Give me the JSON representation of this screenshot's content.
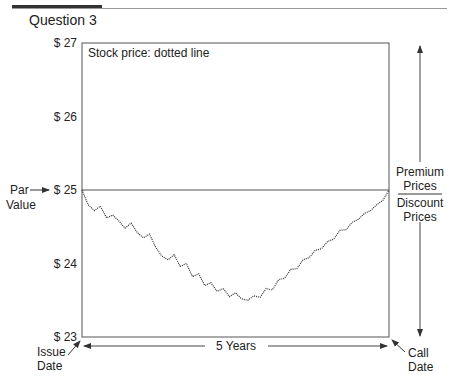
{
  "header": {
    "question_label": "Question 3"
  },
  "chart_data": {
    "type": "line",
    "title": "",
    "legend_note": "Stock price: dotted line",
    "xlabel": "5 Years",
    "ylabel": "",
    "xlim": [
      0,
      5
    ],
    "ylim": [
      23,
      27
    ],
    "yticks": [
      27,
      26,
      25,
      24,
      23
    ],
    "ytick_labels": [
      "$ 27",
      "$ 26",
      "$ 25",
      "$ 24",
      "$ 23"
    ],
    "grid": false,
    "reference_lines": [
      {
        "name": "Par Value",
        "y": 25
      }
    ],
    "annotations": {
      "par_label": "Par\nValue",
      "issue_date": "Issue\nDate",
      "call_date": "Call\nDate",
      "premium": "Premium\nPrices",
      "discount": "Discount\nPrices",
      "duration": "5 Years"
    },
    "series": [
      {
        "name": "Stock price",
        "style": "dotted",
        "x": [
          0,
          0.1,
          0.2,
          0.3,
          0.4,
          0.5,
          0.6,
          0.7,
          0.8,
          0.9,
          1.0,
          1.1,
          1.2,
          1.3,
          1.4,
          1.5,
          1.6,
          1.7,
          1.8,
          1.9,
          2.0,
          2.1,
          2.2,
          2.3,
          2.4,
          2.5,
          2.6,
          2.7,
          2.8,
          2.9,
          3.0,
          3.1,
          3.2,
          3.3,
          3.4,
          3.5,
          3.6,
          3.7,
          3.8,
          3.9,
          4.0,
          4.1,
          4.2,
          4.3,
          4.4,
          4.5,
          4.6,
          4.7,
          4.8,
          4.9,
          5.0
        ],
        "y": [
          25.0,
          24.8,
          24.72,
          24.78,
          24.62,
          24.66,
          24.58,
          24.48,
          24.55,
          24.42,
          24.35,
          24.4,
          24.22,
          24.1,
          24.05,
          24.12,
          23.96,
          24.0,
          23.82,
          23.86,
          23.7,
          23.74,
          23.62,
          23.66,
          23.55,
          23.6,
          23.52,
          23.5,
          23.56,
          23.54,
          23.66,
          23.64,
          23.78,
          23.8,
          23.92,
          23.93,
          24.05,
          24.08,
          24.18,
          24.2,
          24.3,
          24.33,
          24.45,
          24.46,
          24.56,
          24.6,
          24.68,
          24.72,
          24.8,
          24.86,
          25.0
        ]
      }
    ]
  }
}
